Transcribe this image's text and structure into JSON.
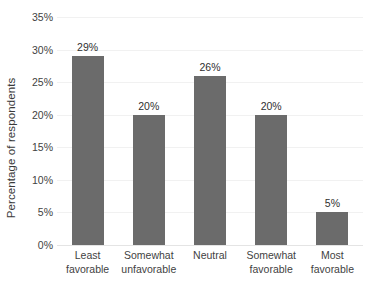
{
  "chart_data": {
    "type": "bar",
    "title": "",
    "subtitle": "",
    "xlabel": "",
    "ylabel": "Percentage of respondents",
    "categories": [
      "Least favorable",
      "Somewhat unfavorable",
      "Neutral",
      "Somewhat favorable",
      "Most favorable"
    ],
    "category_lines": [
      [
        "Least",
        "favorable"
      ],
      [
        "Somewhat",
        "unfavorable"
      ],
      [
        "Neutral",
        ""
      ],
      [
        "Somewhat",
        "favorable"
      ],
      [
        "Most",
        "favorable"
      ]
    ],
    "values": [
      29,
      20,
      26,
      20,
      5
    ],
    "value_labels": [
      "29%",
      "20%",
      "26%",
      "20%",
      "5%"
    ],
    "ylim": [
      0,
      35
    ],
    "ytick_values": [
      0,
      5,
      10,
      15,
      20,
      25,
      30,
      35
    ],
    "ytick_labels": [
      "0%",
      "5%",
      "10%",
      "15%",
      "20%",
      "25%",
      "30%",
      "35%"
    ],
    "grid": true,
    "grid_axis": "y",
    "legend": false,
    "legend_position": "none",
    "bar_color": "#6b6b6b",
    "gridline_color": "#f1f1f1",
    "axis_color": "#e4e4e4",
    "background_color": "#ffffff",
    "text_color": "#3f3f3f"
  }
}
